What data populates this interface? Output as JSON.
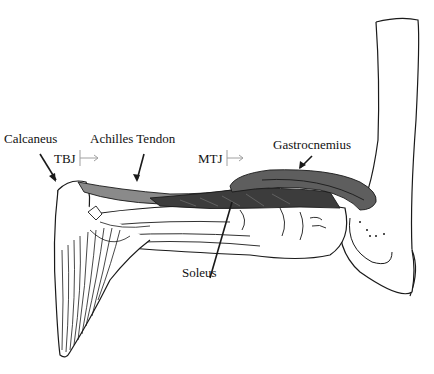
{
  "figure": {
    "labels": {
      "calcaneus": "Calcaneus",
      "achilles_tendon": "Achilles Tendon",
      "tbj": "TBJ",
      "mtj": "MTJ",
      "gastrocnemius": "Gastrocnemius",
      "soleus": "Soleus"
    },
    "colors": {
      "outline": "#1a1a1a",
      "tendon": "#8a8a8a",
      "gastrocnemius": "#5e5e5e",
      "soleus": "#3c3c3c",
      "junction_arrow": "#a0a0a0"
    }
  }
}
